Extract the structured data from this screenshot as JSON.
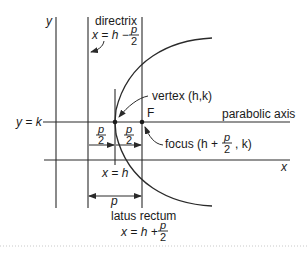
{
  "diagram": {
    "labels": {
      "y_axis": "y",
      "x_axis": "x",
      "directrix": "directrix",
      "directrix_eq_prefix": "x = h −",
      "frac_num": "p",
      "frac_den": "2",
      "vertex": "vertex (h,k)",
      "focus_point": "F",
      "parabolic_axis": "parabolic axis",
      "axis_eq": "y = k",
      "focus_prefix": "focus (h +",
      "focus_suffix": ", k)",
      "vertex_line_eq": "x = h",
      "p_label": "p",
      "latus_rectum": "latus rectum",
      "latus_eq_prefix": "x = h +"
    },
    "colors": {
      "line": "#2a2a2a",
      "text": "#1a1a1a",
      "dotted_rule": "#c8c8c8"
    }
  }
}
